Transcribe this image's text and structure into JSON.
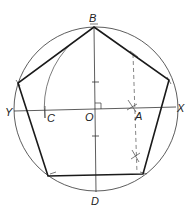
{
  "diagram": {
    "colors": {
      "stroke": "#1a1a1a",
      "thin": "#444444",
      "dashed": "#666666",
      "background": "#ffffff"
    },
    "circle": {
      "center": "O",
      "cx": 96,
      "cy": 109,
      "r": 82
    },
    "labels": {
      "B": "B",
      "D": "D",
      "X": "X",
      "Y": "Y",
      "O": "O",
      "A": "A",
      "C": "C"
    },
    "points": {
      "B": [
        94,
        27
      ],
      "D": [
        96,
        191
      ],
      "X": [
        176,
        107
      ],
      "Y": [
        14,
        111
      ],
      "O": [
        96,
        109
      ],
      "A": [
        132,
        108
      ],
      "C": [
        45,
        110
      ]
    },
    "pentagon_vertices": [
      [
        94,
        27
      ],
      [
        169,
        80
      ],
      [
        143,
        174
      ],
      [
        48,
        176
      ],
      [
        18,
        83
      ]
    ],
    "dashed_line": {
      "from": [
        133,
        54
      ],
      "to": [
        137,
        173
      ]
    },
    "arc_BC": {
      "description": "arc centered at A from B to C"
    },
    "right_angle_marker": "at O"
  }
}
